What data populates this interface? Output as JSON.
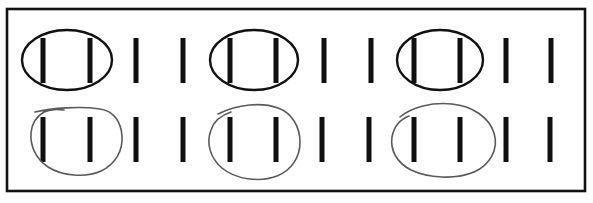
{
  "worksheet": {
    "title": "Tally marks grouped in pairs",
    "background_color": "#ffffff",
    "ink_color": "#101010",
    "pencil_color": "#5a5a5a",
    "border": {
      "name": "outer-frame",
      "x": 7,
      "y": 9,
      "width": 578,
      "height": 182,
      "stroke": "#111111",
      "stroke_width": 2.6
    },
    "rows": [
      {
        "row_index": 1,
        "name": "top-row",
        "grouping_style": "ellipse",
        "mark_count": 10,
        "group_count": 3,
        "mark_top": 38,
        "mark_height": 45,
        "mark_width": 5,
        "mark_positions": [
          43,
          90,
          136,
          183,
          230,
          276,
          324,
          371,
          414,
          460,
          506,
          551
        ],
        "groups": [
          {
            "name": "group-1",
            "cx": 67,
            "cy": 60,
            "rx": 45,
            "ry": 30,
            "encircles": [
              43,
              90
            ]
          },
          {
            "name": "group-2",
            "cx": 254,
            "cy": 60,
            "rx": 44,
            "ry": 30,
            "encircles": [
              230,
              276
            ]
          },
          {
            "name": "group-3",
            "cx": 440,
            "cy": 60,
            "rx": 43,
            "ry": 30,
            "encircles": [
              414,
              460
            ]
          }
        ]
      },
      {
        "row_index": 2,
        "name": "bottom-row",
        "grouping_style": "hand-drawn-loop",
        "mark_count": 10,
        "group_count": 3,
        "mark_top": 117,
        "mark_height": 45,
        "mark_width": 5,
        "mark_positions": [
          43,
          90,
          136,
          183,
          230,
          276,
          322,
          369,
          414,
          460,
          506,
          550
        ],
        "groups": [
          {
            "name": "loop-1",
            "encircles": [
              43,
              90
            ]
          },
          {
            "name": "loop-2",
            "encircles": [
              230,
              276
            ]
          },
          {
            "name": "loop-3",
            "encircles": [
              414,
              460
            ]
          }
        ]
      }
    ]
  }
}
